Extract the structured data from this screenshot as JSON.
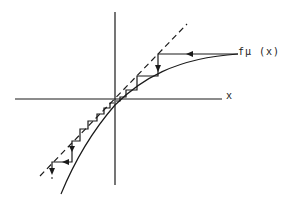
{
  "diagram": {
    "type": "cobweb-plot",
    "labels": {
      "x_axis": "x",
      "curve": "fμ (x)"
    },
    "elements": {
      "axes": [
        "horizontal x-axis",
        "vertical y-axis"
      ],
      "diagonal": "dashed line y = x",
      "curve": "concave increasing curve through origin",
      "iteration": "staircase cobweb path with arrows converging toward the origin fixed point"
    },
    "colors": {
      "ink": "#1a1a1a",
      "background": "#ffffff"
    }
  }
}
